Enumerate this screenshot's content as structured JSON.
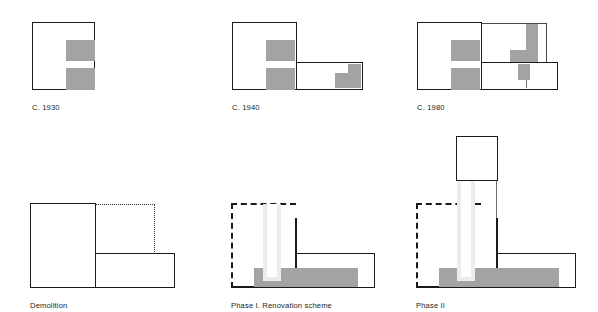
{
  "figure": {
    "background_color": "#ffffff",
    "stroke_color": "#1a1a1a",
    "fill_gray": "#a3a3a3",
    "fill_light_gray": "#ececec"
  },
  "panels": [
    {
      "id": "c-1930",
      "caption": "C. 1930",
      "description": "Single square block with two gray bars on right side"
    },
    {
      "id": "c-1940",
      "caption": "C. 1940",
      "description": "Original block plus lower right wing with gray block and white notch"
    },
    {
      "id": "c-1980",
      "caption": "C. 1980",
      "description": "Original block, upper right addition with L-shaped gray, and lower right wing"
    },
    {
      "id": "demolition",
      "caption": "Demolition",
      "description": "Remaining block and wing with dotted outline showing demolished portion"
    },
    {
      "id": "phase-1",
      "caption": "Phase I. Renovation scheme",
      "description": "Renovated plan with horizontal gray band and vertical light slot"
    },
    {
      "id": "phase-2",
      "caption": "Phase II",
      "description": "Phase I plan with new tower above connected by light vertical shaft"
    }
  ]
}
